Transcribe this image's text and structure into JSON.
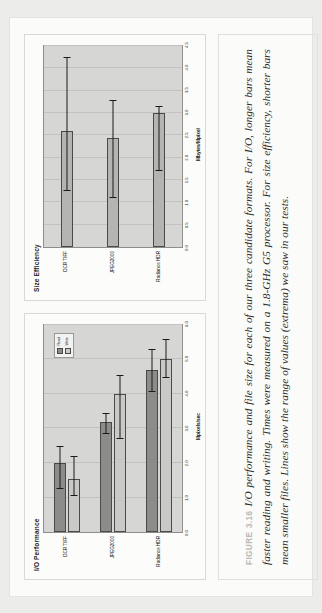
{
  "page": {
    "figure_label": "FIGURE 3.16",
    "caption": "I/O performance and file size for each of our three candidate formats. For I/O, longer bars mean faster reading and writing. Times were measured on a 1.8-GHz G5 processor. For size efficiency, shorter bars mean smaller files. Lines show the range of values (extrema) we saw in our tests.",
    "label_color": "#b9b9b6"
  },
  "chart_data": [
    {
      "id": "io-performance",
      "type": "bar",
      "orientation": "horizontal",
      "title": "I/O Performance",
      "xlabel": "Mpixels/sec",
      "ylabel": "",
      "categories": [
        "DCR TIFF",
        "JPEG2000",
        "Radiance HDR"
      ],
      "series": [
        {
          "name": "Read",
          "values": [
            2.0,
            3.2,
            4.7
          ],
          "color": "#8c8c8a",
          "err_low": [
            1.25,
            2.85,
            4.05
          ],
          "err_high": [
            2.5,
            3.45,
            5.3
          ]
        },
        {
          "name": "Write",
          "values": [
            1.55,
            4.0,
            5.0
          ],
          "color": "#c9c9c6",
          "err_low": [
            1.05,
            2.7,
            4.45
          ],
          "err_high": [
            2.2,
            4.55,
            5.6
          ]
        }
      ],
      "xlim": [
        0.0,
        6.0
      ],
      "xticks": [
        "0.0",
        "1.0",
        "2.0",
        "3.0",
        "4.0",
        "5.0",
        "6.0"
      ],
      "legend": {
        "position": "top-right",
        "entries": [
          "Read",
          "Write"
        ]
      },
      "grid": true
    },
    {
      "id": "size-efficiency",
      "type": "bar",
      "orientation": "horizontal",
      "title": "Size Efficiency",
      "xlabel": "Mbytes/Mpixel",
      "ylabel": "",
      "categories": [
        "DCR TIFF",
        "JPEG2000",
        "Radiance HDR"
      ],
      "series": [
        {
          "name": "Size",
          "values": [
            2.6,
            2.45,
            3.0
          ],
          "color": "#b4b4b1",
          "err_low": [
            1.25,
            1.1,
            1.7
          ],
          "err_high": [
            4.25,
            3.3,
            3.15
          ]
        }
      ],
      "xlim": [
        0.0,
        4.5
      ],
      "xticks": [
        "0.0",
        "0.5",
        "1.0",
        "1.5",
        "2.0",
        "2.5",
        "3.0",
        "3.5",
        "4.0",
        "4.5"
      ],
      "legend": {
        "position": "none",
        "entries": []
      },
      "grid": true
    }
  ]
}
